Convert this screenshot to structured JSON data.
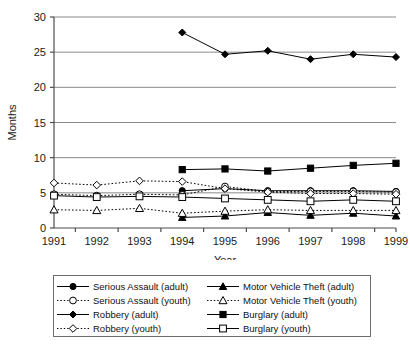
{
  "chart_data": {
    "type": "line",
    "title": "",
    "xlabel": "Year",
    "ylabel": "Months",
    "categories": [
      "1991",
      "1992",
      "1993",
      "1994",
      "1995",
      "1996",
      "1997",
      "1998",
      "1999"
    ],
    "x": [
      1991,
      1992,
      1993,
      1994,
      1995,
      1996,
      1997,
      1998,
      1999
    ],
    "ylim": [
      0,
      30
    ],
    "yticks": [
      0,
      5,
      10,
      15,
      20,
      25,
      30
    ],
    "grid": "horizontal",
    "legend_position": "bottom",
    "series": [
      {
        "name": "Serious Assault (adult)",
        "marker": "filled-circle",
        "line": "solid",
        "values": [
          null,
          null,
          null,
          5.3,
          5.6,
          5.3,
          5.3,
          5.3,
          5.2
        ]
      },
      {
        "name": "Robbery (adult)",
        "marker": "filled-diamond",
        "line": "solid",
        "values": [
          null,
          null,
          null,
          27.8,
          24.7,
          25.2,
          24.0,
          24.7,
          24.3
        ]
      },
      {
        "name": "Motor Vehicle Theft (adult)",
        "marker": "filled-triangle",
        "line": "solid",
        "values": [
          null,
          null,
          null,
          1.5,
          1.7,
          2.2,
          1.8,
          2.1,
          1.7
        ]
      },
      {
        "name": "Burglary (adult)",
        "marker": "filled-square",
        "line": "solid",
        "values": [
          null,
          null,
          null,
          8.3,
          8.4,
          8.1,
          8.5,
          8.9,
          9.2
        ]
      },
      {
        "name": "Serious Assault (youth)",
        "marker": "open-circle",
        "line": "dotted",
        "values": [
          4.8,
          4.6,
          4.8,
          4.7,
          5.9,
          5.2,
          5.2,
          5.2,
          5.1
        ]
      },
      {
        "name": "Robbery (youth)",
        "marker": "open-diamond",
        "line": "dotted",
        "values": [
          6.4,
          6.1,
          6.7,
          6.6,
          5.6,
          5.1,
          4.9,
          4.9,
          4.8
        ]
      },
      {
        "name": "Motor Vehicle Theft (youth)",
        "marker": "open-triangle",
        "line": "dotted",
        "values": [
          2.6,
          2.5,
          2.8,
          2.1,
          2.4,
          2.6,
          2.5,
          2.5,
          2.5
        ]
      },
      {
        "name": "Burglary (youth)",
        "marker": "open-square",
        "line": "solid",
        "values": [
          4.6,
          4.4,
          4.5,
          4.4,
          4.2,
          4.0,
          3.8,
          4.0,
          3.8
        ]
      }
    ]
  },
  "axes": {
    "y_title": "Months",
    "x_title": "Year",
    "y_tick_labels": [
      "0",
      "5",
      "10",
      "15",
      "20",
      "25",
      "30"
    ],
    "x_tick_labels": [
      "1991",
      "1992",
      "1993",
      "1994",
      "1995",
      "1996",
      "1997",
      "1998",
      "1999"
    ]
  },
  "legend": {
    "entries": [
      {
        "label": "Serious Assault (adult)",
        "marker": "filled-circle",
        "line": "solid"
      },
      {
        "label": "Serious Assault (youth)",
        "marker": "open-circle",
        "line": "dotted"
      },
      {
        "label": "Robbery (adult)",
        "marker": "filled-diamond",
        "line": "solid"
      },
      {
        "label": "Robbery (youth)",
        "marker": "open-diamond",
        "line": "dotted"
      },
      {
        "label": "Motor Vehicle Theft (adult)",
        "marker": "filled-triangle",
        "line": "solid"
      },
      {
        "label": "Motor Vehicle Theft (youth)",
        "marker": "open-triangle",
        "line": "dotted"
      },
      {
        "label": "Burglary (adult)",
        "marker": "filled-square",
        "line": "solid"
      },
      {
        "label": "Burglary (youth)",
        "marker": "open-square",
        "line": "solid"
      }
    ]
  },
  "colors": {
    "line": "#000000",
    "grid": "#8a8a8a",
    "axis": "#4d4d4d",
    "text": "#111111",
    "background": "#ffffff"
  }
}
